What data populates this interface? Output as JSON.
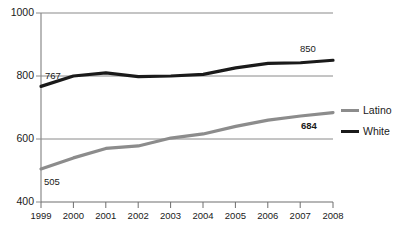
{
  "chart_data": {
    "type": "line",
    "title": "",
    "subtitle": "",
    "xlabel": "",
    "ylabel": "",
    "x": [
      1999,
      2000,
      2001,
      2002,
      2003,
      2004,
      2005,
      2006,
      2007,
      2008
    ],
    "categories": [
      "1999",
      "2000",
      "2001",
      "2002",
      "2003",
      "2004",
      "2005",
      "2006",
      "2007",
      "2008"
    ],
    "xlim": [
      1999,
      2008
    ],
    "ylim": [
      400,
      1000
    ],
    "yticks": [
      400,
      600,
      800,
      1000
    ],
    "ytick_labels": [
      "400",
      "600",
      "800",
      "1000"
    ],
    "grid": true,
    "grid_axis": "y",
    "legend_position": "right",
    "series": [
      {
        "name": "Latino",
        "color": "#8c8c8c",
        "values": [
          505,
          540,
          570,
          578,
          603,
          616,
          640,
          660,
          673,
          684
        ]
      },
      {
        "name": "White",
        "color": "#1a1a1a",
        "values": [
          767,
          800,
          810,
          798,
          800,
          805,
          826,
          840,
          842,
          850
        ]
      }
    ],
    "annotations": [
      {
        "text": "767",
        "series": "White",
        "x": 1999,
        "y": 767,
        "bold": false
      },
      {
        "text": "850",
        "series": "White",
        "x": 2008,
        "y": 850,
        "bold": false
      },
      {
        "text": "505",
        "series": "Latino",
        "x": 1999,
        "y": 505,
        "bold": false
      },
      {
        "text": "684",
        "series": "Latino",
        "x": 2008,
        "y": 684,
        "bold": true
      }
    ]
  },
  "legend": {
    "items": [
      {
        "label": "Latino",
        "color": "#8c8c8c"
      },
      {
        "label": "White",
        "color": "#1a1a1a"
      }
    ]
  },
  "axes": {
    "y_ticks": [
      {
        "label": "1000"
      },
      {
        "label": "800"
      },
      {
        "label": "600"
      },
      {
        "label": "400"
      }
    ],
    "x_ticks": [
      {
        "label": "1999"
      },
      {
        "label": "2000"
      },
      {
        "label": "2001"
      },
      {
        "label": "2002"
      },
      {
        "label": "2003"
      },
      {
        "label": "2004"
      },
      {
        "label": "2005"
      },
      {
        "label": "2006"
      },
      {
        "label": "2007"
      },
      {
        "label": "2008"
      }
    ]
  },
  "annotations": {
    "white_start": "767",
    "white_end": "850",
    "latino_start": "505",
    "latino_end": "684"
  },
  "colors": {
    "latino": "#8c8c8c",
    "white": "#1a1a1a",
    "grid": "#808080",
    "axis": "#808080",
    "background": "#ffffff"
  }
}
